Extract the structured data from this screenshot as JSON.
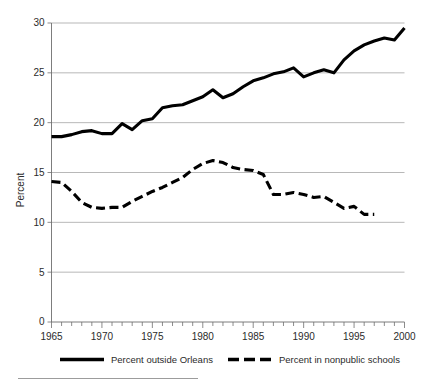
{
  "chart_data": {
    "type": "line",
    "title": "",
    "subtitle": "",
    "xlabel": "",
    "ylabel": "Percent",
    "xlim": [
      1965,
      2000
    ],
    "ylim": [
      0,
      30
    ],
    "yticks": [
      0,
      5,
      10,
      15,
      20,
      25,
      30
    ],
    "ytick_labels": [
      "0",
      "5",
      "10",
      "15",
      "20",
      "25",
      "30"
    ],
    "xticks": [
      1965,
      1970,
      1975,
      1980,
      1985,
      1990,
      1995,
      2000
    ],
    "xtick_labels": [
      "1965",
      "1970",
      "1975",
      "1980",
      "1985",
      "1990",
      "1995",
      "2000"
    ],
    "x_minor_tick_interval": 1,
    "grid": "horizontal",
    "legend_position": "bottom",
    "x": [
      1965,
      1966,
      1967,
      1968,
      1969,
      1970,
      1971,
      1972,
      1973,
      1974,
      1975,
      1976,
      1977,
      1978,
      1979,
      1980,
      1981,
      1982,
      1983,
      1984,
      1985,
      1986,
      1987,
      1988,
      1989,
      1990,
      1991,
      1992,
      1993,
      1994,
      1995,
      1996,
      1997,
      1998,
      1999,
      2000
    ],
    "series": [
      {
        "name": "Percent outside Orleans",
        "style": "solid",
        "color": "#000000",
        "values": [
          18.6,
          18.6,
          18.8,
          19.1,
          19.2,
          18.9,
          18.9,
          19.9,
          19.3,
          20.2,
          20.4,
          21.5,
          21.7,
          21.8,
          22.2,
          22.6,
          23.3,
          22.5,
          22.9,
          23.6,
          24.2,
          24.5,
          24.9,
          25.1,
          25.5,
          24.6,
          25.0,
          25.3,
          25.0,
          26.3,
          27.2,
          27.8,
          28.2,
          28.5,
          28.3,
          29.5
        ]
      },
      {
        "name": "Percent in nonpublic schools",
        "style": "dashed",
        "color": "#000000",
        "values": [
          14.1,
          14.0,
          13.1,
          12.0,
          11.5,
          11.4,
          11.5,
          11.5,
          12.1,
          12.6,
          13.1,
          13.5,
          14.0,
          14.5,
          15.3,
          15.9,
          16.2,
          16.0,
          15.5,
          15.3,
          15.2,
          14.8,
          12.8,
          12.8,
          13.0,
          12.8,
          12.5,
          12.6,
          12.0,
          11.4,
          11.6,
          10.8,
          10.8,
          null,
          null,
          null
        ]
      }
    ]
  },
  "legend": {
    "items": [
      {
        "label": "Percent outside Orleans",
        "style": "solid"
      },
      {
        "label": "Percent in nonpublic schools",
        "style": "dashed"
      }
    ]
  }
}
